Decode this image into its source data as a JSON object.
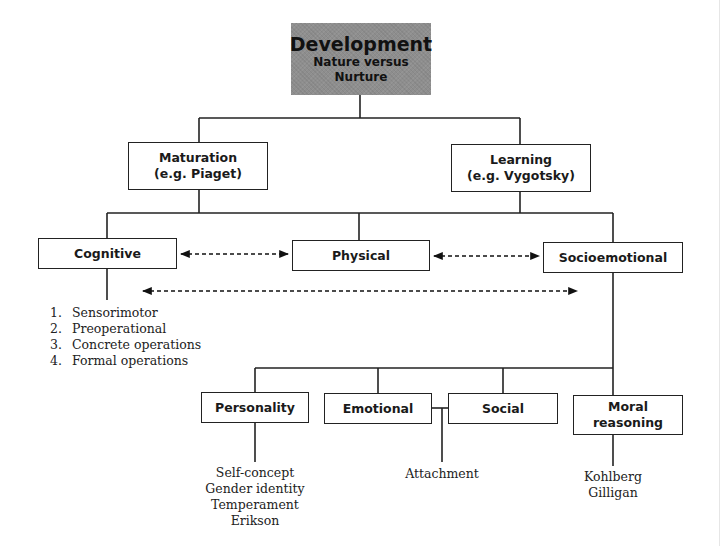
{
  "root": {
    "title": "Development",
    "subtitle_line1": "Nature versus",
    "subtitle_line2": "Nurture",
    "fill_color": "#8e8e8e"
  },
  "level1": [
    {
      "line1": "Maturation",
      "line2": "(e.g. Piaget)"
    },
    {
      "line1": "Learning",
      "line2": "(e.g. Vygotsky)"
    }
  ],
  "level2": [
    {
      "label": "Cognitive"
    },
    {
      "label": "Physical"
    },
    {
      "label": "Socioemotional"
    }
  ],
  "cognitive_stages": [
    {
      "num": "1.",
      "text": "Sensorimotor"
    },
    {
      "num": "2.",
      "text": "Preoperational"
    },
    {
      "num": "3.",
      "text": "Concrete operations"
    },
    {
      "num": "4.",
      "text": "Formal operations"
    }
  ],
  "level3": [
    {
      "label": "Personality"
    },
    {
      "label": "Emotional"
    },
    {
      "label": "Social"
    },
    {
      "line1": "Moral",
      "line2": "reasoning"
    }
  ],
  "personality_items": [
    "Self-concept",
    "Gender identity",
    "Temperament",
    "Erikson"
  ],
  "emotional_social_items": [
    "Attachment"
  ],
  "moral_items": [
    "Kohlberg",
    "Gilligan"
  ],
  "bidirectional_links": [
    {
      "from": "Cognitive",
      "to": "Physical"
    },
    {
      "from": "Physical",
      "to": "Socioemotional"
    },
    {
      "from": "Cognitive",
      "to": "Socioemotional"
    }
  ]
}
